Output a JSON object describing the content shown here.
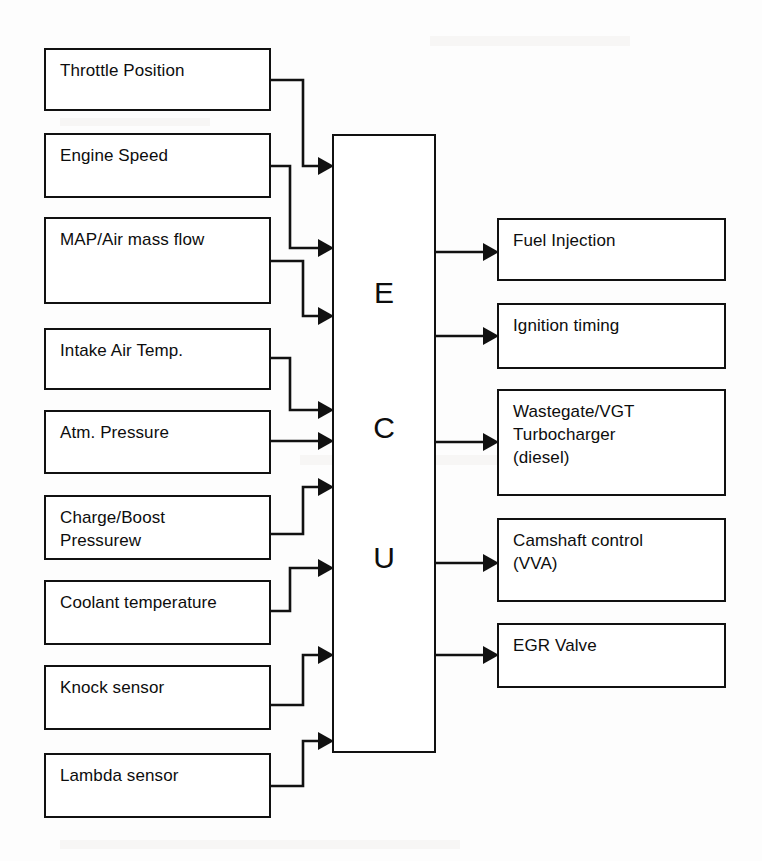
{
  "diagram": {
    "ecu": {
      "letters": [
        "E",
        "C",
        "U"
      ],
      "name": "ECU"
    },
    "inputs": [
      {
        "label": "Throttle Position"
      },
      {
        "label": "Engine Speed"
      },
      {
        "label": "MAP/Air mass flow"
      },
      {
        "label": "Intake Air Temp."
      },
      {
        "label": "Atm. Pressure"
      },
      {
        "label": "Charge/Boost\nPressurew"
      },
      {
        "label": "Coolant temperature"
      },
      {
        "label": "Knock sensor"
      },
      {
        "label": "Lambda sensor"
      }
    ],
    "outputs": [
      {
        "label": "Fuel Injection"
      },
      {
        "label": "Ignition timing"
      },
      {
        "label": "Wastegate/VGT\nTurbocharger\n(diesel)"
      },
      {
        "label": "Camshaft control\n(VVA)"
      },
      {
        "label": "EGR Valve"
      }
    ],
    "colors": {
      "stroke": "#111111",
      "fill": "#ffffff",
      "background": "#fdfdfd",
      "text": "#0d0d0d"
    }
  }
}
